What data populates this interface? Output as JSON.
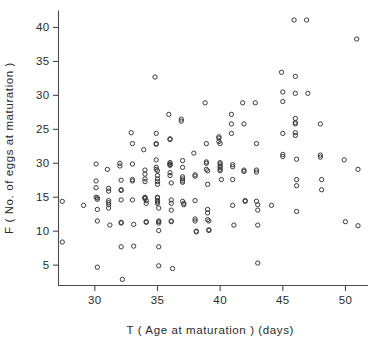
{
  "chart_data": {
    "type": "scatter",
    "title": "",
    "xlabel": "T  ( Age at maturation )  (days)",
    "ylabel": "F  ( No. of eggs at maturation )",
    "xlim": [
      27.1,
      51.8
    ],
    "ylim": [
      2.0,
      42.5
    ],
    "grid": false,
    "legend": false,
    "xticks": [
      30,
      35,
      40,
      45,
      50
    ],
    "xtick_labels": [
      "30",
      "35",
      "40",
      "45",
      "50"
    ],
    "yticks": [
      5,
      10,
      15,
      20,
      25,
      30,
      35,
      40
    ],
    "ytick_labels": [
      "5",
      "10",
      "15",
      "30",
      "25",
      "30",
      "35",
      "40"
    ],
    "ytick_label_note": "As printed in the original figure the 4th tick (value 20) is mislabelled '30', duplicating the 6th label.",
    "marker": "open-circle",
    "marker_color": "#3a3a3a",
    "n_points": 208,
    "points": [
      [
        27.4,
        14.4
      ],
      [
        27.4,
        8.4
      ],
      [
        29.1,
        13.8
      ],
      [
        30.1,
        19.9
      ],
      [
        30.1,
        17.4
      ],
      [
        30.1,
        16.4
      ],
      [
        30.1,
        15.0
      ],
      [
        30.2,
        14.9
      ],
      [
        30.2,
        14.7
      ],
      [
        30.2,
        13.2
      ],
      [
        30.2,
        11.5
      ],
      [
        30.2,
        4.7
      ],
      [
        31.0,
        19.1
      ],
      [
        31.1,
        16.3
      ],
      [
        31.1,
        15.9
      ],
      [
        31.1,
        14.5
      ],
      [
        31.1,
        14.2
      ],
      [
        31.1,
        13.9
      ],
      [
        31.1,
        13.4
      ],
      [
        31.2,
        10.9
      ],
      [
        32.0,
        20.0
      ],
      [
        32.0,
        19.6
      ],
      [
        32.1,
        17.5
      ],
      [
        32.1,
        16.1
      ],
      [
        32.1,
        16.0
      ],
      [
        32.1,
        14.6
      ],
      [
        32.1,
        11.3
      ],
      [
        32.1,
        11.2
      ],
      [
        32.1,
        7.7
      ],
      [
        32.2,
        2.9
      ],
      [
        32.9,
        24.5
      ],
      [
        33.0,
        22.9
      ],
      [
        33.0,
        19.9
      ],
      [
        33.0,
        17.6
      ],
      [
        33.0,
        17.4
      ],
      [
        33.0,
        14.6
      ],
      [
        33.1,
        11.0
      ],
      [
        33.1,
        7.8
      ],
      [
        33.9,
        22.0
      ],
      [
        34.0,
        19.0
      ],
      [
        34.0,
        18.4
      ],
      [
        34.0,
        17.7
      ],
      [
        34.0,
        17.3
      ],
      [
        34.0,
        15.0
      ],
      [
        34.0,
        14.9
      ],
      [
        34.0,
        14.8
      ],
      [
        34.1,
        14.5
      ],
      [
        34.1,
        14.1
      ],
      [
        34.1,
        11.4
      ],
      [
        34.1,
        11.3
      ],
      [
        34.8,
        32.7
      ],
      [
        34.9,
        24.4
      ],
      [
        34.9,
        22.9
      ],
      [
        34.9,
        22.8
      ],
      [
        34.9,
        20.5
      ],
      [
        34.9,
        19.4
      ],
      [
        34.9,
        19.1
      ],
      [
        35.0,
        18.9
      ],
      [
        35.0,
        18.2
      ],
      [
        35.0,
        17.7
      ],
      [
        35.0,
        17.3
      ],
      [
        35.0,
        16.9
      ],
      [
        35.0,
        15.0
      ],
      [
        35.0,
        14.9
      ],
      [
        35.0,
        14.5
      ],
      [
        35.0,
        14.3
      ],
      [
        35.0,
        14.1
      ],
      [
        35.1,
        13.4
      ],
      [
        35.1,
        11.5
      ],
      [
        35.1,
        11.4
      ],
      [
        35.1,
        11.2
      ],
      [
        35.1,
        10.1
      ],
      [
        35.1,
        7.7
      ],
      [
        35.1,
        4.9
      ],
      [
        35.9,
        27.2
      ],
      [
        36.0,
        23.6
      ],
      [
        36.0,
        23.5
      ],
      [
        36.0,
        20.1
      ],
      [
        36.0,
        19.9
      ],
      [
        36.0,
        19.8
      ],
      [
        36.0,
        19.7
      ],
      [
        36.0,
        18.6
      ],
      [
        36.0,
        18.2
      ],
      [
        36.1,
        17.1
      ],
      [
        36.1,
        14.6
      ],
      [
        36.1,
        14.1
      ],
      [
        36.1,
        13.1
      ],
      [
        36.1,
        11.5
      ],
      [
        36.1,
        11.4
      ],
      [
        36.2,
        4.5
      ],
      [
        36.9,
        26.5
      ],
      [
        36.9,
        26.2
      ],
      [
        37.0,
        20.4
      ],
      [
        37.0,
        19.4
      ],
      [
        37.0,
        18.0
      ],
      [
        37.0,
        17.7
      ],
      [
        37.0,
        17.4
      ],
      [
        37.0,
        17.2
      ],
      [
        37.0,
        14.4
      ],
      [
        37.1,
        14.1
      ],
      [
        37.1,
        13.9
      ],
      [
        37.9,
        21.5
      ],
      [
        38.0,
        18.3
      ],
      [
        38.0,
        18.1
      ],
      [
        38.0,
        14.5
      ],
      [
        38.0,
        11.8
      ],
      [
        38.0,
        11.5
      ],
      [
        38.1,
        10.0
      ],
      [
        38.1,
        9.9
      ],
      [
        38.8,
        28.9
      ],
      [
        38.9,
        22.9
      ],
      [
        38.9,
        20.2
      ],
      [
        38.9,
        20.0
      ],
      [
        38.9,
        19.1
      ],
      [
        39.0,
        18.9
      ],
      [
        39.0,
        16.9
      ],
      [
        39.0,
        13.2
      ],
      [
        39.0,
        12.7
      ],
      [
        39.0,
        11.7
      ],
      [
        39.1,
        11.5
      ],
      [
        39.1,
        10.2
      ],
      [
        39.1,
        10.1
      ],
      [
        39.9,
        23.9
      ],
      [
        39.9,
        23.7
      ],
      [
        39.9,
        23.2
      ],
      [
        40.0,
        22.9
      ],
      [
        40.0,
        20.1
      ],
      [
        40.0,
        19.9
      ],
      [
        40.0,
        19.6
      ],
      [
        40.0,
        19.4
      ],
      [
        40.0,
        19.1
      ],
      [
        40.0,
        18.9
      ],
      [
        40.1,
        17.6
      ],
      [
        40.9,
        27.2
      ],
      [
        40.9,
        25.8
      ],
      [
        40.9,
        24.4
      ],
      [
        41.0,
        19.8
      ],
      [
        41.0,
        19.5
      ],
      [
        41.0,
        17.6
      ],
      [
        41.0,
        13.8
      ],
      [
        41.1,
        10.9
      ],
      [
        41.8,
        28.9
      ],
      [
        41.9,
        25.8
      ],
      [
        41.9,
        19.0
      ],
      [
        41.9,
        18.8
      ],
      [
        42.0,
        14.5
      ],
      [
        42.0,
        14.4
      ],
      [
        42.8,
        28.9
      ],
      [
        42.9,
        22.9
      ],
      [
        42.9,
        19.0
      ],
      [
        42.9,
        18.7
      ],
      [
        42.9,
        14.4
      ],
      [
        43.0,
        13.9
      ],
      [
        43.0,
        13.1
      ],
      [
        43.0,
        10.9
      ],
      [
        43.0,
        5.3
      ],
      [
        44.1,
        13.8
      ],
      [
        44.9,
        33.4
      ],
      [
        45.0,
        30.5
      ],
      [
        45.0,
        29.1
      ],
      [
        45.0,
        24.4
      ],
      [
        45.0,
        21.3
      ],
      [
        45.0,
        21.0
      ],
      [
        45.9,
        41.1
      ],
      [
        46.0,
        32.8
      ],
      [
        46.0,
        30.3
      ],
      [
        46.0,
        26.6
      ],
      [
        46.0,
        26.0
      ],
      [
        46.0,
        25.8
      ],
      [
        46.0,
        24.5
      ],
      [
        46.0,
        24.1
      ],
      [
        46.1,
        20.6
      ],
      [
        46.1,
        17.6
      ],
      [
        46.1,
        16.7
      ],
      [
        46.1,
        12.9
      ],
      [
        46.9,
        41.1
      ],
      [
        47.0,
        30.3
      ],
      [
        48.0,
        25.8
      ],
      [
        48.0,
        21.2
      ],
      [
        48.0,
        20.9
      ],
      [
        48.1,
        17.6
      ],
      [
        48.1,
        16.1
      ],
      [
        49.9,
        20.5
      ],
      [
        50.0,
        11.4
      ],
      [
        50.9,
        38.3
      ],
      [
        51.0,
        19.1
      ],
      [
        51.0,
        10.8
      ]
    ]
  },
  "axes": {
    "x_tick_count": 5,
    "y_tick_count": 8
  }
}
